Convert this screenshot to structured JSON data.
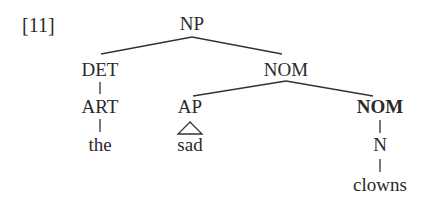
{
  "example_number": "[11]",
  "tree": {
    "root": "NP",
    "nodes": [
      {
        "id": "np",
        "label": "NP",
        "x": 192,
        "y": 14,
        "bold": false
      },
      {
        "id": "det",
        "label": "DET",
        "x": 100,
        "y": 60,
        "bold": false
      },
      {
        "id": "nom1",
        "label": "NOM",
        "x": 286,
        "y": 60,
        "bold": false
      },
      {
        "id": "art",
        "label": "ART",
        "x": 100,
        "y": 97,
        "bold": false
      },
      {
        "id": "ap",
        "label": "AP",
        "x": 190,
        "y": 97,
        "bold": false
      },
      {
        "id": "nom2",
        "label": "NOM",
        "x": 380,
        "y": 97,
        "bold": true
      },
      {
        "id": "the",
        "label": "the",
        "x": 100,
        "y": 135,
        "bold": false
      },
      {
        "id": "sad",
        "label": "sad",
        "x": 190,
        "y": 135,
        "bold": false
      },
      {
        "id": "n",
        "label": "N",
        "x": 380,
        "y": 135,
        "bold": false
      },
      {
        "id": "clowns",
        "label": "clowns",
        "x": 380,
        "y": 175,
        "bold": false
      }
    ],
    "edges": [
      [
        "np",
        "det"
      ],
      [
        "np",
        "nom1"
      ],
      [
        "det",
        "art"
      ],
      [
        "art",
        "the"
      ],
      [
        "nom1",
        "ap"
      ],
      [
        "nom1",
        "nom2"
      ],
      [
        "nom2",
        "n"
      ],
      [
        "n",
        "clowns"
      ]
    ],
    "triangle": {
      "parent": "ap",
      "child": "sad"
    }
  }
}
